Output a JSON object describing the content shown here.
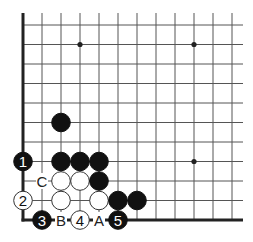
{
  "diagram": {
    "type": "go-board-corner",
    "grid": {
      "origin_x": 23,
      "origin_y": 25,
      "step_x": 19,
      "step_y": 19.5,
      "cols": 12,
      "rows": 11,
      "extend_top": 12,
      "extend_right": 11
    },
    "star_points": [
      {
        "col": 3,
        "row": 1
      },
      {
        "col": 9,
        "row": 1
      },
      {
        "col": 9,
        "row": 7
      }
    ],
    "stones": [
      {
        "col": 2,
        "row": 5,
        "color": "black",
        "label": ""
      },
      {
        "col": 0,
        "row": 7,
        "color": "black",
        "label": "1"
      },
      {
        "col": 2,
        "row": 7,
        "color": "black",
        "label": ""
      },
      {
        "col": 3,
        "row": 7,
        "color": "black",
        "label": ""
      },
      {
        "col": 4,
        "row": 7,
        "color": "black",
        "label": ""
      },
      {
        "col": 2,
        "row": 8,
        "color": "white",
        "label": ""
      },
      {
        "col": 3,
        "row": 8,
        "color": "white",
        "label": ""
      },
      {
        "col": 4,
        "row": 8,
        "color": "black",
        "label": ""
      },
      {
        "col": 0,
        "row": 9,
        "color": "white",
        "label": "2"
      },
      {
        "col": 2,
        "row": 9,
        "color": "white",
        "label": ""
      },
      {
        "col": 4,
        "row": 9,
        "color": "white",
        "label": ""
      },
      {
        "col": 5,
        "row": 9,
        "color": "black",
        "label": ""
      },
      {
        "col": 6,
        "row": 9,
        "color": "black",
        "label": ""
      },
      {
        "col": 1,
        "row": 10,
        "color": "black",
        "label": "3"
      },
      {
        "col": 3,
        "row": 10,
        "color": "white",
        "label": "4"
      },
      {
        "col": 5,
        "row": 10,
        "color": "black",
        "label": "5"
      }
    ],
    "point_labels": [
      {
        "col": 1,
        "row": 8,
        "text": "C"
      },
      {
        "col": 2,
        "row": 10,
        "text": "B"
      },
      {
        "col": 4,
        "row": 10,
        "text": "A"
      }
    ],
    "colors": {
      "line": "#555555",
      "edge": "#222222",
      "black_stone": "#111111",
      "white_stone": "#ffffff",
      "stone_outline": "#333333"
    }
  }
}
